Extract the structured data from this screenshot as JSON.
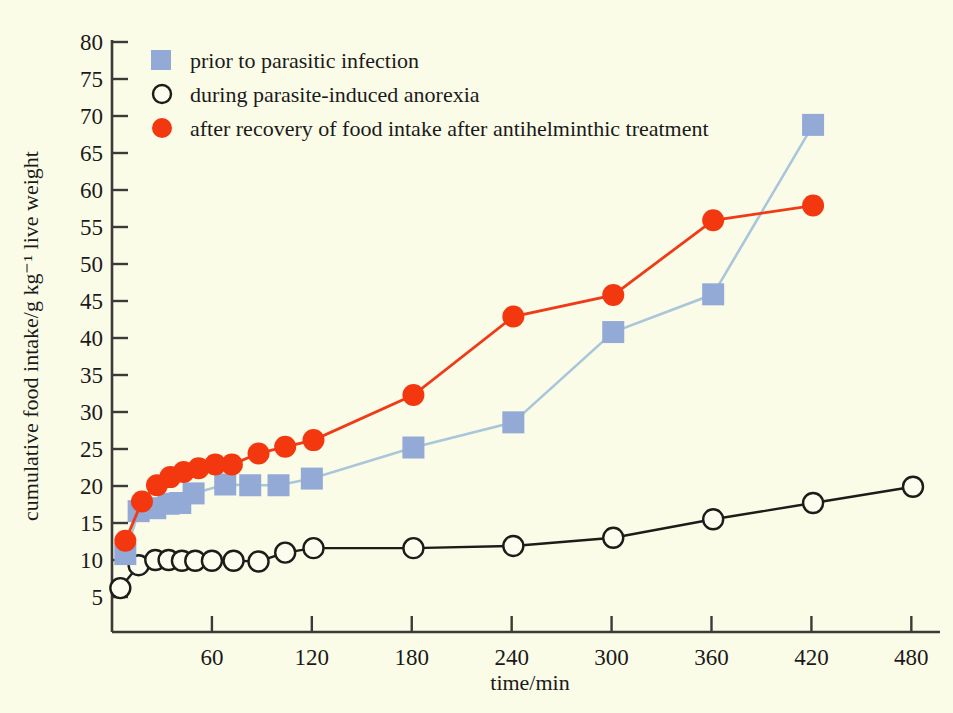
{
  "background_color": "#fbfce8",
  "axes": {
    "x": {
      "label": "time/min",
      "ticks": [
        60,
        120,
        180,
        240,
        300,
        360,
        420,
        480
      ],
      "min": 0,
      "max": 500
    },
    "y": {
      "label": "cumulative food intake/g kg⁻¹ live weight",
      "ticks": [
        5,
        10,
        15,
        20,
        25,
        30,
        35,
        40,
        45,
        50,
        55,
        60,
        65,
        70,
        75,
        80
      ],
      "min": 2,
      "max": 80
    }
  },
  "legend": {
    "position": "top-left-inside",
    "items": [
      {
        "label": "prior to parasitic infection",
        "marker": "square",
        "color": "#93a9d6"
      },
      {
        "label": "during parasite-induced anorexia",
        "marker": "open-circle",
        "color": "#1c1c18"
      },
      {
        "label": "after recovery of food intake after antihelminthic treatment",
        "marker": "filled-circle",
        "color": "#f3380f"
      }
    ]
  },
  "chart_data": {
    "type": "line",
    "title": "",
    "xlabel": "time/min",
    "ylabel": "cumulative food intake/g kg⁻¹ live weight",
    "xlim": [
      0,
      500
    ],
    "ylim": [
      2,
      80
    ],
    "grid": false,
    "legend_position": "top-left-inside",
    "series": [
      {
        "name": "prior to parasitic infection",
        "marker": "square",
        "color": "#93a9d6",
        "line_color": "#a9c6da",
        "points": [
          {
            "x": 8,
            "y": 10.8
          },
          {
            "x": 16,
            "y": 16.6
          },
          {
            "x": 26,
            "y": 17.0
          },
          {
            "x": 34,
            "y": 17.6
          },
          {
            "x": 41,
            "y": 17.7
          },
          {
            "x": 49,
            "y": 19.0
          },
          {
            "x": 68,
            "y": 20.2
          },
          {
            "x": 83,
            "y": 20.1
          },
          {
            "x": 100,
            "y": 20.1
          },
          {
            "x": 120,
            "y": 21.0
          },
          {
            "x": 181,
            "y": 25.2
          },
          {
            "x": 241,
            "y": 28.6
          },
          {
            "x": 301,
            "y": 40.8
          },
          {
            "x": 361,
            "y": 45.9
          },
          {
            "x": 421,
            "y": 68.8
          }
        ]
      },
      {
        "name": "during parasite-induced anorexia",
        "marker": "open-circle",
        "color": "#1c1c18",
        "line_color": "#1c1c18",
        "points": [
          {
            "x": 5,
            "y": 6.2
          },
          {
            "x": 16,
            "y": 9.3
          },
          {
            "x": 26,
            "y": 10.0
          },
          {
            "x": 34,
            "y": 10.0
          },
          {
            "x": 42,
            "y": 9.9
          },
          {
            "x": 50,
            "y": 9.9
          },
          {
            "x": 60,
            "y": 9.9
          },
          {
            "x": 73,
            "y": 9.9
          },
          {
            "x": 88,
            "y": 9.8
          },
          {
            "x": 104,
            "y": 11.0
          },
          {
            "x": 121,
            "y": 11.6
          },
          {
            "x": 181,
            "y": 11.6
          },
          {
            "x": 241,
            "y": 11.9
          },
          {
            "x": 301,
            "y": 13.0
          },
          {
            "x": 361,
            "y": 15.5
          },
          {
            "x": 421,
            "y": 17.7
          },
          {
            "x": 481,
            "y": 19.9
          }
        ]
      },
      {
        "name": "after recovery of food intake after antihelminthic treatment",
        "marker": "filled-circle",
        "color": "#f3380f",
        "line_color": "#ef3b18",
        "points": [
          {
            "x": 8,
            "y": 12.6
          },
          {
            "x": 18,
            "y": 17.9
          },
          {
            "x": 27,
            "y": 20.1
          },
          {
            "x": 35,
            "y": 21.2
          },
          {
            "x": 43,
            "y": 21.9
          },
          {
            "x": 52,
            "y": 22.4
          },
          {
            "x": 62,
            "y": 22.9
          },
          {
            "x": 72,
            "y": 22.9
          },
          {
            "x": 88,
            "y": 24.4
          },
          {
            "x": 104,
            "y": 25.3
          },
          {
            "x": 121,
            "y": 26.2
          },
          {
            "x": 181,
            "y": 32.3
          },
          {
            "x": 241,
            "y": 42.9
          },
          {
            "x": 301,
            "y": 45.8
          },
          {
            "x": 361,
            "y": 55.9
          },
          {
            "x": 421,
            "y": 57.9
          }
        ]
      }
    ]
  }
}
